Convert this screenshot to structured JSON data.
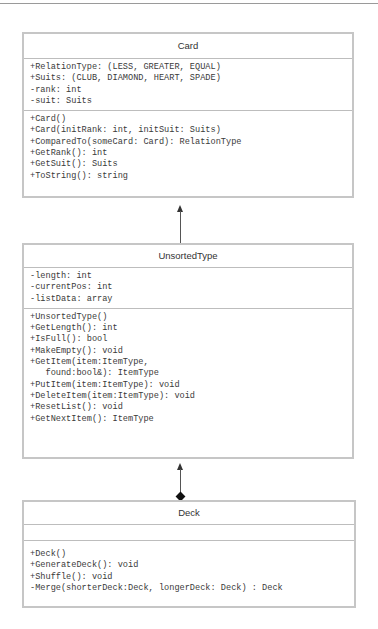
{
  "diagram": {
    "type": "UML class diagram",
    "classes": [
      {
        "name": "Card",
        "attributes": [
          "+RelationType: (LESS, GREATER, EQUAL)",
          "+Suits: (CLUB, DIAMOND, HEART, SPADE)",
          "-rank: int",
          "-suit: Suits"
        ],
        "methods": [
          "+Card()",
          "+Card(initRank: int, initSuit: Suits)",
          "+ComparedTo(someCard: Card): RelationType",
          "+GetRank(): int",
          "+GetSuit(): Suits",
          "+ToString(): string"
        ]
      },
      {
        "name": "UnsortedType",
        "attributes": [
          "-length: int",
          "-currentPos: int",
          "-listData: array"
        ],
        "methods": [
          "+UnsortedType()",
          "+GetLength(): int",
          "+IsFull(): bool",
          "+MakeEmpty(): void",
          "+GetItem(item:ItemType,",
          "   found:bool&): ItemType",
          "+PutItem(item:ItemType): void",
          "+DeleteItem(item:ItemType): void",
          "+ResetList(): void",
          "+GetNextItem(): ItemType"
        ]
      },
      {
        "name": "Deck",
        "attributes": [],
        "methods": [
          "+Deck()",
          "+GenerateDeck(): void",
          "+Shuffle(): void",
          "-Merge(shorterDeck:Deck, longerDeck: Deck) : Deck"
        ]
      }
    ],
    "relationships": [
      {
        "from": "UnsortedType",
        "to": "Card",
        "kind": "association-arrow"
      },
      {
        "from": "Deck",
        "to": "UnsortedType",
        "kind": "composition-arrow"
      }
    ]
  }
}
